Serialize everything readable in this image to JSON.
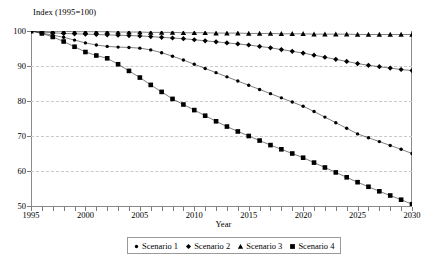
{
  "chart_data": {
    "type": "line",
    "title": "Index (1995=100)",
    "xlabel": "Year",
    "ylabel": "",
    "xlim": [
      1995,
      2030
    ],
    "ylim": [
      50,
      100
    ],
    "yticks": [
      50,
      60,
      70,
      80,
      90,
      100
    ],
    "xticks_labeled": [
      1995,
      2000,
      2005,
      2010,
      2015,
      2020,
      2025,
      2030
    ],
    "xticks_minor_every": 1,
    "grid": "horizontal-dashed",
    "legend_position": "bottom-center",
    "x": [
      1995,
      1996,
      1997,
      1998,
      1999,
      2000,
      2001,
      2002,
      2003,
      2004,
      2005,
      2006,
      2007,
      2008,
      2009,
      2010,
      2011,
      2012,
      2013,
      2014,
      2015,
      2016,
      2017,
      2018,
      2019,
      2020,
      2021,
      2022,
      2023,
      2024,
      2025,
      2026,
      2027,
      2028,
      2029,
      2030
    ],
    "series": [
      {
        "name": "Scenario 1",
        "marker": "small-circle",
        "values": [
          100.0,
          99.4,
          98.8,
          98.2,
          97.4,
          96.6,
          96.0,
          95.6,
          95.4,
          95.3,
          95.1,
          94.6,
          93.8,
          92.8,
          91.7,
          90.5,
          89.3,
          88.1,
          86.9,
          85.7,
          84.5,
          83.3,
          82.1,
          80.9,
          79.7,
          78.5,
          77.0,
          75.4,
          73.8,
          72.2,
          70.6,
          69.5,
          68.4,
          67.3,
          66.2,
          65.0
        ]
      },
      {
        "name": "Scenario 2",
        "marker": "diamond",
        "values": [
          100.0,
          99.7,
          99.5,
          99.3,
          99.2,
          99.1,
          99.0,
          98.9,
          98.8,
          98.7,
          98.6,
          98.4,
          98.2,
          98.0,
          97.8,
          97.5,
          97.2,
          96.9,
          96.6,
          96.3,
          96.0,
          95.6,
          95.2,
          94.7,
          94.2,
          93.7,
          93.1,
          92.5,
          91.9,
          91.3,
          90.7,
          90.2,
          89.8,
          89.4,
          89.0,
          88.7
        ]
      },
      {
        "name": "Scenario 3",
        "marker": "triangle",
        "values": [
          100.0,
          99.9,
          99.9,
          99.9,
          99.8,
          99.8,
          99.8,
          99.8,
          99.7,
          99.7,
          99.7,
          99.6,
          99.6,
          99.6,
          99.5,
          99.5,
          99.5,
          99.4,
          99.4,
          99.4,
          99.3,
          99.3,
          99.3,
          99.2,
          99.2,
          99.2,
          99.1,
          99.1,
          99.1,
          99.1,
          99.0,
          99.0,
          99.0,
          99.0,
          99.0,
          99.0
        ]
      },
      {
        "name": "Scenario 4",
        "marker": "large-square",
        "values": [
          100.0,
          99.3,
          98.3,
          97.0,
          95.5,
          94.0,
          93.0,
          92.2,
          90.5,
          88.6,
          86.7,
          84.6,
          82.6,
          80.6,
          79.0,
          77.4,
          75.8,
          74.2,
          72.7,
          71.3,
          70.0,
          68.7,
          67.4,
          66.2,
          65.0,
          63.8,
          62.4,
          61.0,
          59.6,
          58.2,
          56.8,
          55.5,
          54.2,
          53.0,
          51.8,
          50.5
        ]
      }
    ]
  },
  "legend": {
    "items": [
      {
        "label": "Scenario 1",
        "marker": "small-circle"
      },
      {
        "label": "Scenario 2",
        "marker": "diamond"
      },
      {
        "label": "Scenario 3",
        "marker": "triangle"
      },
      {
        "label": "Scenario 4",
        "marker": "large-square"
      }
    ]
  },
  "colors": {
    "series": "#000000",
    "grid": "#c9c9c9",
    "axis": "#8a8a8a",
    "background": "#ffffff"
  }
}
